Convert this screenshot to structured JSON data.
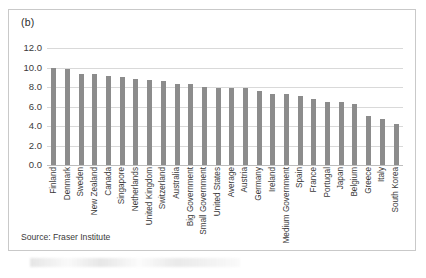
{
  "figure": {
    "panel_label": "(b)",
    "source_note": "Source: Fraser Institute"
  },
  "chart_data": {
    "type": "bar",
    "title": "(b)",
    "xlabel": "",
    "ylabel": "",
    "ylim": [
      0.0,
      12.0
    ],
    "ytick_values": [
      12.0,
      10.0,
      8.0,
      6.0,
      4.0,
      2.0,
      0.0
    ],
    "ytick_labels": [
      "12.0",
      "10.0",
      "8.0",
      "6.0",
      "4.0",
      "2.0",
      "0.0"
    ],
    "grid": true,
    "legend": false,
    "bar_color": "#8c8c8c",
    "gridline_color": "#d9d9d9",
    "orientation": "vertical",
    "xtick_rotation": -90,
    "annotation": "Source: Fraser Institute",
    "categories": [
      "Finland",
      "Denmark",
      "Sweden",
      "New Zealand",
      "Canada",
      "Singapore",
      "Netherlands",
      "United Kingdom",
      "Switzerland",
      "Australia",
      "Big Government",
      "Small Government",
      "United States",
      "Average",
      "Austria",
      "Germany",
      "Ireland",
      "Medium Government",
      "Spain",
      "France",
      "Portugal",
      "Japan",
      "Belgium",
      "Greece",
      "Italy",
      "South Korea"
    ],
    "values": [
      10.0,
      9.8,
      9.3,
      9.35,
      9.1,
      9.05,
      8.85,
      8.7,
      8.65,
      8.3,
      8.35,
      8.05,
      7.9,
      7.85,
      7.85,
      7.6,
      7.25,
      7.3,
      7.1,
      6.8,
      6.5,
      6.5,
      6.3,
      5.0,
      4.75,
      4.2
    ]
  }
}
